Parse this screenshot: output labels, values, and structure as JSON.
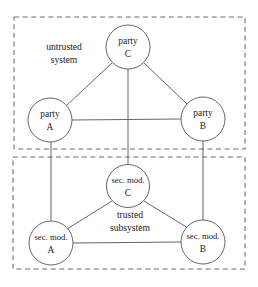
{
  "diagram": {
    "colors": {
      "background": "#ffffff",
      "stroke": "#555555",
      "box_stroke": "#6a6a6a",
      "text": "#1a1a1a"
    },
    "groups": [
      {
        "id": "untrusted-system",
        "label_line1": "untrusted",
        "label_line2": "system",
        "x": 14,
        "y": 17,
        "width": 231,
        "height": 132,
        "label_x": 64,
        "label_y1": 48,
        "label_y2": 61
      },
      {
        "id": "trusted-subsystem",
        "label_line1": "trusted",
        "label_line2": "subsystem",
        "x": 13,
        "y": 157,
        "width": 232,
        "height": 112,
        "label_x": 130,
        "label_y1": 216,
        "label_y2": 229
      }
    ],
    "nodes": [
      {
        "id": "party-c",
        "line1": "party",
        "line2": "C",
        "cx": 128,
        "cy": 47,
        "r": 22,
        "small": false
      },
      {
        "id": "party-a",
        "line1": "party",
        "line2": "A",
        "cx": 50,
        "cy": 120,
        "r": 22,
        "small": false
      },
      {
        "id": "party-b",
        "line1": "party",
        "line2": "B",
        "cx": 203,
        "cy": 119,
        "r": 22,
        "small": false
      },
      {
        "id": "sec-mod-c",
        "line1": "sec. mod.",
        "line2": "C",
        "cx": 128,
        "cy": 186,
        "r": 21.5,
        "small": true
      },
      {
        "id": "sec-mod-a",
        "line1": "sec. mod.",
        "line2": "A",
        "cx": 51,
        "cy": 243,
        "r": 22,
        "small": true
      },
      {
        "id": "sec-mod-b",
        "line1": "sec. mod.",
        "line2": "B",
        "cx": 203,
        "cy": 242,
        "r": 22,
        "small": true
      }
    ],
    "edges": [
      {
        "id": "edge-party-c-party-a",
        "x1": 112,
        "y1": 63,
        "x2": 66,
        "y2": 106
      },
      {
        "id": "edge-party-c-party-b",
        "x1": 144,
        "y1": 63,
        "x2": 188,
        "y2": 105
      },
      {
        "id": "edge-party-a-party-b",
        "x1": 72,
        "y1": 120,
        "x2": 181,
        "y2": 119
      },
      {
        "id": "edge-party-c-sec-mod-c",
        "x1": 128,
        "y1": 69,
        "x2": 128,
        "y2": 164
      },
      {
        "id": "edge-party-a-sec-mod-a",
        "x1": 51,
        "y1": 142,
        "x2": 51,
        "y2": 221
      },
      {
        "id": "edge-party-b-sec-mod-b",
        "x1": 203,
        "y1": 141,
        "x2": 203,
        "y2": 220
      },
      {
        "id": "edge-sec-mod-c-sec-mod-a",
        "x1": 112,
        "y1": 201,
        "x2": 67,
        "y2": 229
      },
      {
        "id": "edge-sec-mod-c-sec-mod-b",
        "x1": 144,
        "y1": 201,
        "x2": 188,
        "y2": 228
      },
      {
        "id": "edge-sec-mod-a-sec-mod-b",
        "x1": 73,
        "y1": 243,
        "x2": 181,
        "y2": 242
      }
    ]
  }
}
